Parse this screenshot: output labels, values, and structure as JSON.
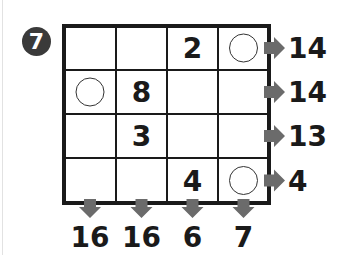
{
  "puzzle": {
    "number": "7",
    "rows": 4,
    "cols": 4,
    "cells": [
      [
        "",
        "",
        "2",
        "circle"
      ],
      [
        "circle",
        "8",
        "",
        ""
      ],
      [
        "",
        "3",
        "",
        ""
      ],
      [
        "",
        "",
        "4",
        "circle"
      ]
    ],
    "row_clues": [
      "14",
      "14",
      "13",
      "4"
    ],
    "col_clues": [
      "16",
      "16",
      "6",
      "7"
    ],
    "colors": {
      "grid": "#1a1a1a",
      "arrow": "#6b6b6b",
      "badge": "#3a3a3a",
      "text": "#1a1a1a"
    }
  }
}
